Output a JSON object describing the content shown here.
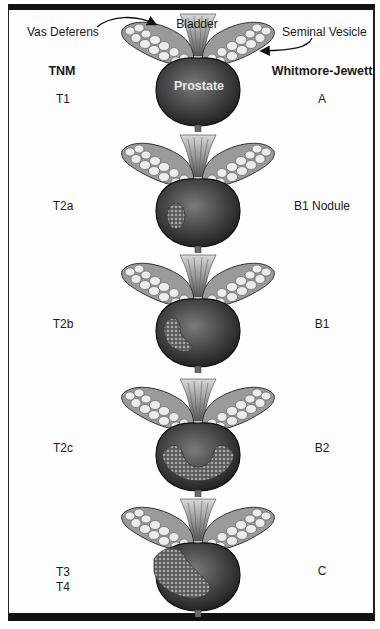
{
  "figure": {
    "anatomy_labels": {
      "vas_deferens": "Vas Deferens",
      "bladder": "Bladder",
      "seminal_vesicle": "Seminal Vesicle",
      "prostate": "Prostate"
    },
    "column_headers": {
      "left": "TNM",
      "right": "Whitmore-Jewett"
    },
    "stages": [
      {
        "tnm": "T1",
        "tnm2": "",
        "whitmore_jewett": "A",
        "tumor": "none"
      },
      {
        "tnm": "T2a",
        "tnm2": "",
        "whitmore_jewett": "B1 Nodule",
        "tumor": "small-nodule-left"
      },
      {
        "tnm": "T2b",
        "tnm2": "",
        "whitmore_jewett": "B1",
        "tumor": "one-lobe"
      },
      {
        "tnm": "T2c",
        "tnm2": "",
        "whitmore_jewett": "B2",
        "tumor": "both-lobes"
      },
      {
        "tnm": "T3",
        "tnm2": "T4",
        "whitmore_jewett": "C",
        "tumor": "extracapsular"
      }
    ]
  },
  "colors": {
    "frame": "#111111",
    "prostate_dark": "#2b2b2b",
    "prostate_mid": "#6a6a6a",
    "vesicle_light": "#e6e6e6",
    "tumor": "#8a8a8a"
  }
}
